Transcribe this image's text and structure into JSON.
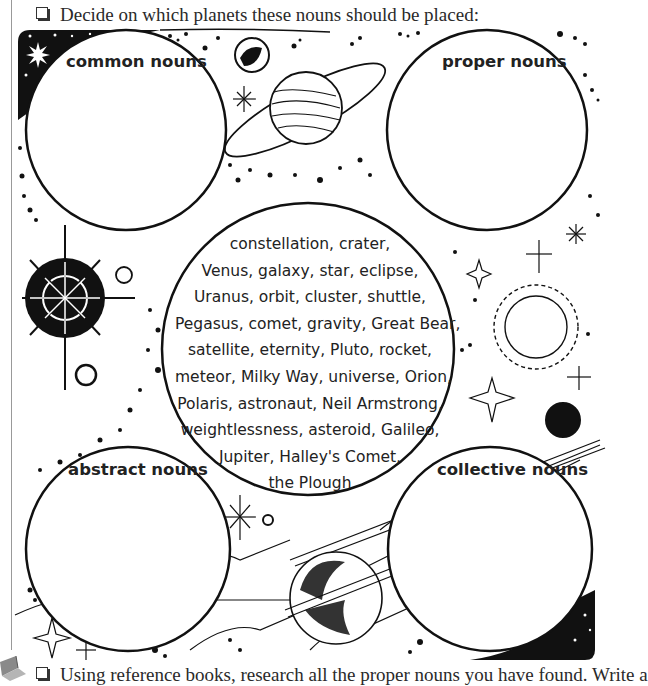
{
  "instructions": {
    "top": "Decide on which planets these nouns should be placed:",
    "bottom": "Using reference books, research all the proper nouns you have found. Write a"
  },
  "planets": {
    "common": {
      "label": "common nouns"
    },
    "proper": {
      "label": "proper nouns"
    },
    "abstract": {
      "label": "abstract nouns"
    },
    "collective": {
      "label": "collective nouns"
    }
  },
  "word_bank": {
    "lines": [
      "constellation, crater,",
      "Venus, galaxy, star, eclipse,",
      "Uranus, orbit, cluster, shuttle,",
      "Pegasus, comet, gravity, Great Bear,",
      "satellite, eternity, Pluto, rocket,",
      "meteor, Milky Way, universe, Orion,",
      "Polaris, astronaut, Neil Armstrong,",
      "weightlessness, asteroid, Galileo,",
      "Jupiter, Halley's Comet,",
      "the Plough"
    ]
  },
  "icons": {
    "checkbox_top": "checkbox-icon",
    "checkbox_bottom": "checkbox-icon",
    "book": "book-icon"
  },
  "colors": {
    "ink": "#1a1a1a",
    "paper": "#ffffff",
    "rule": "#999999"
  }
}
